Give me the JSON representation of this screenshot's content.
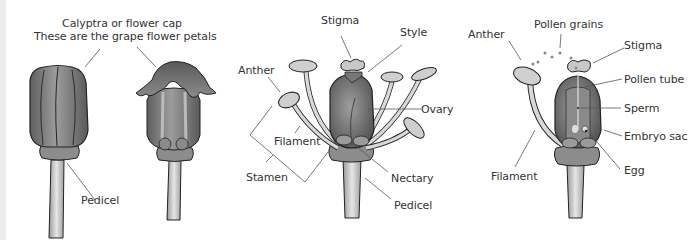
{
  "figure": {
    "panels": [
      {
        "id": "closed-and-opening-flower",
        "labels": {
          "calyptra_line1": "Calyptra or flower cap",
          "calyptra_line2": "These are the grape flower petals",
          "pedicel": "Pedicel"
        }
      },
      {
        "id": "open-flower-anatomy",
        "labels": {
          "stigma": "Stigma",
          "style": "Style",
          "anther": "Anther",
          "ovary": "Ovary",
          "filament": "Filament",
          "stamen": "Stamen",
          "nectary": "Nectary",
          "pedicel": "Pedicel"
        }
      },
      {
        "id": "pollination-fertilization",
        "labels": {
          "pollen_grains": "Pollen grains",
          "anther": "Anther",
          "stigma": "Stigma",
          "pollen_tube": "Pollen tube",
          "sperm": "Sperm",
          "embryo_sac": "Embryo sac",
          "egg": "Egg",
          "filament": "Filament"
        }
      }
    ],
    "colors": {
      "ovary_dark": "#6f6f6f",
      "ovary_light": "#a8a8a8",
      "stem_light": "#dcdcdc",
      "outline": "#222222",
      "leader_line": "#555555",
      "text": "#333333"
    }
  }
}
